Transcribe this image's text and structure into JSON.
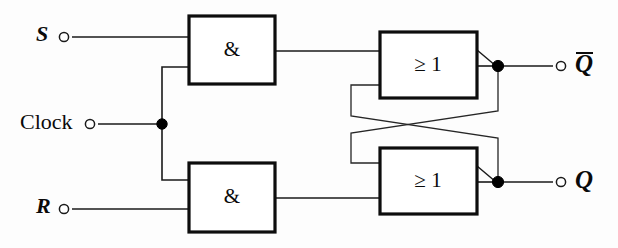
{
  "diagram": {
    "kind": "logic-circuit-schematic",
    "background_color": "#fdfdfd",
    "line_color": "#1a1a1a",
    "width": 618,
    "height": 248
  },
  "inputs": [
    {
      "id": "s",
      "label": "S",
      "style": "italic",
      "terminal_x": 64,
      "terminal_y": 37,
      "label_x": 36,
      "label_y": 36
    },
    {
      "id": "clock",
      "label": "Clock",
      "style": "upright",
      "terminal_x": 90,
      "terminal_y": 124,
      "label_x": 20,
      "label_y": 124
    },
    {
      "id": "r",
      "label": "R",
      "style": "italic",
      "terminal_x": 64,
      "terminal_y": 209,
      "label_x": 36,
      "label_y": 208
    }
  ],
  "outputs": [
    {
      "id": "q_not",
      "label": "Q",
      "overbar": true,
      "terminal_x": 561,
      "terminal_y": 66,
      "label_x": 575,
      "label_y": 66
    },
    {
      "id": "q",
      "label": "Q",
      "overbar": false,
      "terminal_x": 561,
      "terminal_y": 182,
      "label_x": 575,
      "label_y": 182
    }
  ],
  "gates": [
    {
      "id": "and-top",
      "type": "AND",
      "label": "&",
      "x": 189,
      "y": 16,
      "width": 86,
      "height": 68,
      "label_x": 232,
      "label_y": 51
    },
    {
      "id": "and-bottom",
      "type": "AND",
      "label": "&",
      "x": 189,
      "y": 163,
      "width": 86,
      "height": 69,
      "label_x": 232,
      "label_y": 198
    },
    {
      "id": "or-top",
      "type": "OR",
      "label": "≥ 1",
      "x": 380,
      "y": 32,
      "width": 97,
      "height": 66,
      "label_x": 428,
      "label_y": 66
    },
    {
      "id": "or-bottom",
      "type": "OR",
      "label": "≥ 1",
      "x": 380,
      "y": 148,
      "width": 97,
      "height": 66,
      "label_x": 428,
      "label_y": 182
    }
  ],
  "junctions": [
    {
      "id": "clock-fanout",
      "cx": 162,
      "cy": 124,
      "r": 5.2
    },
    {
      "id": "q-not-node",
      "cx": 498,
      "cy": 66,
      "r": 5.6
    },
    {
      "id": "q-node",
      "cx": 498,
      "cy": 182,
      "r": 5.6
    }
  ],
  "negation_wedges": [
    {
      "id": "or-top-wedge",
      "x1": 477,
      "y1": 50,
      "x2": 496,
      "y2": 66
    },
    {
      "id": "or-bottom-wedge",
      "x1": 477,
      "y1": 166,
      "x2": 496,
      "y2": 182
    }
  ],
  "wires": [
    {
      "id": "s-to-and-top",
      "d": "M 72 37 L 189 37"
    },
    {
      "id": "r-to-and-bottom",
      "d": "M 72 209 L 189 209"
    },
    {
      "id": "clock-to-fanout",
      "d": "M 98 124 L 162 124"
    },
    {
      "id": "clock-up-to-and-top",
      "d": "M 162 124 L 162 67 L 189 67"
    },
    {
      "id": "clock-down-to-and-bottom",
      "d": "M 162 124 L 162 180 L 189 180"
    },
    {
      "id": "and-top-to-or-top",
      "d": "M 275 51 L 380 51"
    },
    {
      "id": "and-bottom-to-or-bottom",
      "d": "M 275 198 L 380 198"
    },
    {
      "id": "or-top-out-to-node",
      "d": "M 477 66 L 498 66"
    },
    {
      "id": "or-bottom-out-to-node",
      "d": "M 477 182 L 498 182"
    },
    {
      "id": "q-not-node-to-terminal",
      "d": "M 498 66 L 553 66"
    },
    {
      "id": "q-node-to-terminal",
      "d": "M 498 182 L 553 182"
    },
    {
      "id": "cross-top-to-bottom",
      "d": "M 498 66 L 498 111 L 351 133 L 351 163 L 380 163"
    },
    {
      "id": "cross-bottom-to-top",
      "d": "M 498 182 L 498 138 L 351 116 L 351 85 L 380 85"
    }
  ],
  "legend": {
    "and_symbol": "&",
    "or_symbol": "≥ 1",
    "description": "Two AND gates gated by Clock feed a cross-coupled pair of OR gates with inverted outputs."
  }
}
